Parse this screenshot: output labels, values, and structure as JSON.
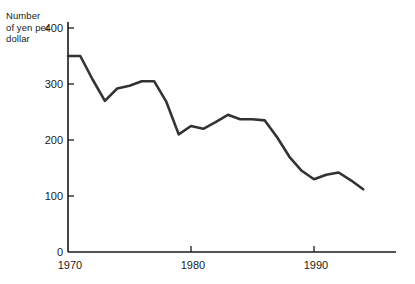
{
  "chart_data": {
    "type": "line",
    "title": "",
    "ylabel": "Number of yen per dollar",
    "xlabel": "",
    "ylabel_lines": [
      "Number",
      "of yen per",
      "dollar"
    ],
    "xlim": [
      1970,
      1996
    ],
    "ylim": [
      0,
      400
    ],
    "grid": false,
    "legend": false,
    "yticks": [
      0,
      100,
      200,
      300,
      400
    ],
    "ytick_labels": [
      "0",
      "100",
      "200",
      "300",
      "400"
    ],
    "xticks": [
      1970,
      1980,
      1990
    ],
    "xtick_labels": [
      "1970",
      "1980",
      "1990"
    ],
    "line_color": "#333333",
    "axis_color": "#1a1a1a",
    "x": [
      1970,
      1971,
      1972,
      1973,
      1974,
      1975,
      1976,
      1977,
      1978,
      1979,
      1980,
      1981,
      1982,
      1983,
      1984,
      1985,
      1986,
      1987,
      1988,
      1989,
      1990,
      1991,
      1992,
      1993,
      1994
    ],
    "values": [
      350,
      350,
      308,
      270,
      292,
      297,
      305,
      305,
      268,
      210,
      225,
      220,
      232,
      245,
      237,
      237,
      235,
      205,
      170,
      145,
      130,
      138,
      142,
      128,
      112
    ],
    "series": [
      {
        "name": "Yen per dollar",
        "values": [
          350,
          350,
          308,
          270,
          292,
          297,
          305,
          305,
          268,
          210,
          225,
          220,
          232,
          245,
          237,
          237,
          235,
          205,
          170,
          145,
          130,
          138,
          142,
          128,
          112
        ]
      }
    ]
  }
}
